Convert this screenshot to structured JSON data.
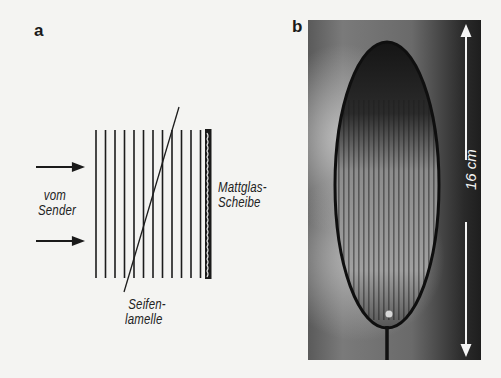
{
  "figure": {
    "panel_a": {
      "label": "a",
      "source_label_line1": "vom",
      "source_label_line2": "Sender",
      "plate_label_line1": "Mattglas-",
      "plate_label_line2": "Scheibe",
      "film_label_line1": "Seifen-",
      "film_label_line2": "lamelle",
      "wavefront_count": 12
    },
    "panel_b": {
      "label": "b",
      "scale_label": "16 cm"
    }
  }
}
